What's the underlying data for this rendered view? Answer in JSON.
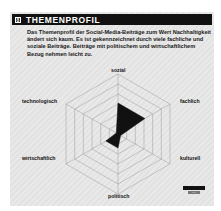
{
  "header": {
    "number": "8",
    "title": "THEMENPROFIL"
  },
  "description": "Das Themenprofil der Social-Media-Beiträge zum Wert Nachhaltigkeit ändert sich kaum. Es ist gekennzeichnet durch viele fachliche und soziale Beiträge. Beiträge mit politischem und wirtschaftlichem Bezug nehmen leicht zu.",
  "colors": {
    "series": "#111111",
    "grid": "#9a9a9a",
    "header_bg": "#111111"
  },
  "chart_data": {
    "type": "radar",
    "title": "THEMENPROFIL",
    "axes": [
      "sozial",
      "fachlich",
      "kulturell",
      "politisch",
      "wirtschaftlich",
      "technologisch"
    ],
    "series": [
      {
        "name": "2016",
        "values": [
          3.1,
          3.1,
          0.3,
          1.4,
          1.4,
          0.2
        ]
      }
    ],
    "range": [
      0,
      6
    ],
    "rings": 6,
    "grid": true,
    "legend_position": "bottom-right"
  },
  "legend": {
    "items": [
      {
        "label": "2016",
        "color": "#111111"
      }
    ]
  }
}
